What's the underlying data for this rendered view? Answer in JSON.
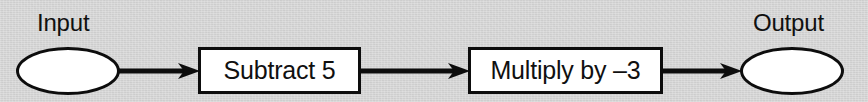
{
  "diagram": {
    "background_color": "#d6d6d6",
    "stroke_color": "#0d0d0d",
    "fill_color": "#ffffff",
    "input_label": "Input",
    "output_label": "Output",
    "steps": [
      {
        "id": "step-1",
        "label": "Subtract 5"
      },
      {
        "id": "step-2",
        "label": "Multiply by –3"
      }
    ],
    "connectors": [
      {
        "id": "arrow-1",
        "from": "Input",
        "to": "Subtract 5",
        "icon": "arrow-right-icon"
      },
      {
        "id": "arrow-2",
        "from": "Subtract 5",
        "to": "Multiply by –3",
        "icon": "arrow-right-icon"
      },
      {
        "id": "arrow-3",
        "from": "Multiply by –3",
        "to": "Output",
        "icon": "arrow-right-icon"
      }
    ]
  }
}
